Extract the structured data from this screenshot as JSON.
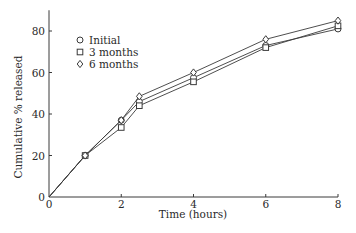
{
  "chart_data": {
    "type": "line",
    "title": "",
    "xlabel": "Time (hours)",
    "ylabel": "Cumulative % released",
    "xlim": [
      0,
      8
    ],
    "ylim": [
      0,
      90
    ],
    "xticks": [
      0,
      2,
      4,
      6,
      8
    ],
    "yticks": [
      0,
      20,
      40,
      60,
      80
    ],
    "grid": false,
    "legend_position": "upper-left",
    "x": [
      0,
      1,
      2,
      2.5,
      4,
      6,
      8
    ],
    "series": [
      {
        "name": "Initial",
        "marker": "circle",
        "values": [
          0,
          20,
          37,
          46,
          57.5,
          73,
          81
        ]
      },
      {
        "name": "3 months",
        "marker": "square",
        "values": [
          0,
          20,
          33.5,
          44,
          55.5,
          72,
          82.5
        ]
      },
      {
        "name": "6 months",
        "marker": "diamond",
        "values": [
          0,
          20,
          37,
          48.5,
          60,
          76,
          85
        ]
      }
    ]
  },
  "axes": {
    "xlabel": "Time (hours)",
    "ylabel": "Cumulative % released"
  },
  "legend": {
    "items": [
      {
        "label": "Initial"
      },
      {
        "label": "3 months"
      },
      {
        "label": "6 months"
      }
    ]
  }
}
